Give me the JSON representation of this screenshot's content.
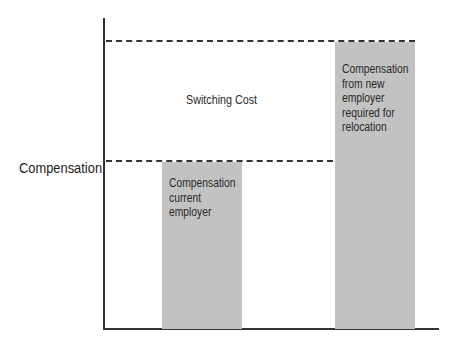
{
  "chart_data": {
    "type": "bar",
    "title": "",
    "xlabel": "",
    "ylabel": "Compensation",
    "categories": [
      "Compensation current employer",
      "Compensation from new employer required for relocation"
    ],
    "values": [
      167,
      287
    ],
    "value_units": "relative height (no numeric scale shown)",
    "grid": false,
    "legend": null,
    "reference_lines": [
      {
        "style": "dashed",
        "level": "current employer compensation"
      },
      {
        "style": "dashed",
        "level": "new employer compensation required for relocation"
      }
    ],
    "annotations": [
      {
        "text": "Switching Cost",
        "position": "between the two dashed lines"
      }
    ]
  },
  "diagram": {
    "y_axis_label": "Compensation",
    "switching_cost_label": "Switching Cost",
    "bars": [
      {
        "id": "current",
        "label": "Compensation\ncurrent\nemployer",
        "color": "#c2c2c2"
      },
      {
        "id": "new",
        "label": "Compensation\nfrom new\nemployer\nrequired for\nrelocation",
        "color": "#c2c2c2"
      }
    ]
  }
}
